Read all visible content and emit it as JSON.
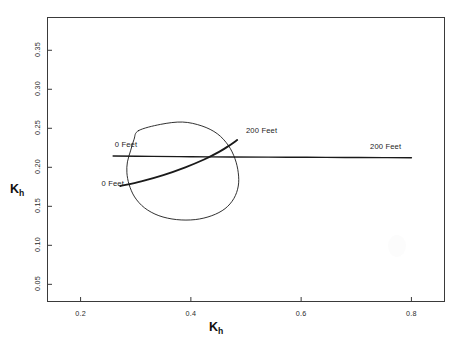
{
  "chart_data": {
    "type": "line",
    "title": "",
    "subtitle": "",
    "xlabel": "K_h",
    "ylabel": "K_h",
    "xlabel_base": "K",
    "xlabel_sub": "h",
    "ylabel_base": "K",
    "ylabel_sub": "h",
    "xlim": [
      0.14,
      0.86
    ],
    "ylim": [
      0.028,
      0.392
    ],
    "xticks": [
      0.2,
      0.4,
      0.6,
      0.8
    ],
    "xtick_labels": [
      "0.2",
      "0.4",
      "0.6",
      "0.8"
    ],
    "yticks": [
      0.05,
      0.1,
      0.15,
      0.2,
      0.25,
      0.3,
      0.35
    ],
    "ytick_labels": [
      "0.05",
      "0.10",
      "0.15",
      "0.20",
      "0.25",
      "0.30",
      "0.35"
    ],
    "grid": false,
    "legend_position": "none",
    "frame": "box",
    "line_color": "#1a1a1a",
    "background_color": "#ffffff",
    "series": [
      {
        "name": "confidence-region-contour",
        "type": "closed-contour",
        "linewidth": 0.9,
        "points": [
          [
            0.305,
            0.247
          ],
          [
            0.345,
            0.255
          ],
          [
            0.385,
            0.258
          ],
          [
            0.42,
            0.253
          ],
          [
            0.448,
            0.243
          ],
          [
            0.468,
            0.228
          ],
          [
            0.48,
            0.211
          ],
          [
            0.486,
            0.193
          ],
          [
            0.486,
            0.176
          ],
          [
            0.478,
            0.16
          ],
          [
            0.462,
            0.147
          ],
          [
            0.438,
            0.138
          ],
          [
            0.408,
            0.133
          ],
          [
            0.374,
            0.133
          ],
          [
            0.342,
            0.138
          ],
          [
            0.316,
            0.148
          ],
          [
            0.298,
            0.162
          ],
          [
            0.288,
            0.178
          ],
          [
            0.284,
            0.193
          ],
          [
            0.285,
            0.207
          ],
          [
            0.291,
            0.222
          ],
          [
            0.297,
            0.236
          ],
          [
            0.305,
            0.247
          ]
        ]
      },
      {
        "name": "upward-trend-line-0-to-200-feet",
        "type": "open-line",
        "linewidth": 1.9,
        "start_label": "0 Feet",
        "end_label": "200 Feet",
        "points": [
          [
            0.272,
            0.176
          ],
          [
            0.31,
            0.182
          ],
          [
            0.35,
            0.19
          ],
          [
            0.39,
            0.2
          ],
          [
            0.424,
            0.21
          ],
          [
            0.452,
            0.22
          ],
          [
            0.472,
            0.229
          ],
          [
            0.484,
            0.235
          ]
        ]
      },
      {
        "name": "horizontal-line-0-to-200-feet",
        "type": "open-line",
        "linewidth": 1.4,
        "start_label": "0 Feet",
        "end_label": "200 Feet",
        "points": [
          [
            0.259,
            0.2145
          ],
          [
            0.33,
            0.214
          ],
          [
            0.4,
            0.2136
          ],
          [
            0.47,
            0.2132
          ],
          [
            0.54,
            0.213
          ],
          [
            0.61,
            0.2128
          ],
          [
            0.68,
            0.2126
          ],
          [
            0.75,
            0.2124
          ],
          [
            0.8,
            0.2122
          ]
        ]
      }
    ],
    "annotations": [
      {
        "text": "0 Feet",
        "x": 0.262,
        "y": 0.228,
        "anchor": "start",
        "for": "horizontal-line"
      },
      {
        "text": "0 Feet",
        "x": 0.238,
        "y": 0.179,
        "anchor": "start",
        "for": "upward-line"
      },
      {
        "text": "200 Feet",
        "x": 0.5,
        "y": 0.247,
        "anchor": "start",
        "for": "upward-line"
      },
      {
        "text": "200 Feet",
        "x": 0.725,
        "y": 0.226,
        "anchor": "start",
        "for": "horizontal-line"
      }
    ]
  }
}
